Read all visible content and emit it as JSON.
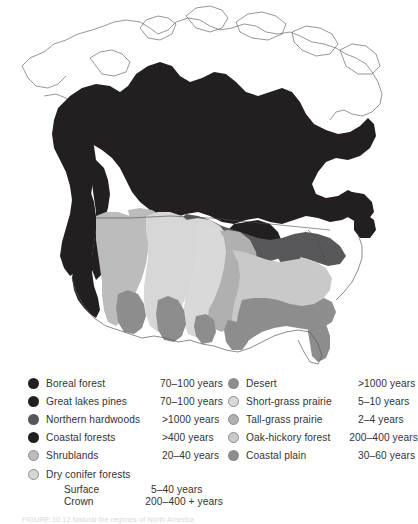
{
  "figure": {
    "title_visible": false,
    "caption": "FIGURE 10.12 Natural fire regimes of North America",
    "caption_label": "FIGURE"
  },
  "map": {
    "name": "north-america-fire-regime-map",
    "description": "Grayscale map of North America showing natural fire-return-interval vegetation zones",
    "background": "#ffffff",
    "outline_color": "#555555"
  },
  "palette": {
    "boreal_forest": "#231f20",
    "great_lakes_pines": "#231f20",
    "northern_hardwoods": "#58585b",
    "coastal_forests": "#231f20",
    "shrublands": "#bcbcbc",
    "dry_conifer_forests": "#d7d7d7",
    "desert": "#8d8d8d",
    "short_grass_prairie": "#d9d9d9",
    "tall_grass_prairie": "#b0b0b0",
    "oak_hickory_forest": "#c9c9c9",
    "coastal_plain": "#8d8d8d",
    "outline": "#555555",
    "text": "#333333"
  },
  "legend": {
    "left_column": [
      {
        "label": "Boreal forest",
        "value": "70–100 years",
        "swatch": "#231f20",
        "outlined": false
      },
      {
        "label": "Great lakes pines",
        "value": "70–100 years",
        "swatch": "#231f20",
        "outlined": false
      },
      {
        "label": "Northern hardwoods",
        "value": ">1000 years",
        "swatch": "#58585b",
        "outlined": false
      },
      {
        "label": "Coastal forests",
        "value": ">400 years",
        "swatch": "#231f20",
        "outlined": false
      },
      {
        "label": "Shrublands",
        "value": "20–40 years",
        "swatch": "#bcbcbc",
        "outlined": true
      },
      {
        "label": "Dry conifer forests",
        "value": "",
        "swatch": "#d7d7d7",
        "outlined": true
      }
    ],
    "left_sub_rows": [
      {
        "label": "Surface",
        "value": "5–40 years"
      },
      {
        "label": "Crown",
        "value": "200–400 + years"
      }
    ],
    "right_column": [
      {
        "label": "Desert",
        "value": ">1000 years",
        "swatch": "#8d8d8d",
        "outlined": false
      },
      {
        "label": "Short-grass prairie",
        "value": "5–10 years",
        "swatch": "#d9d9d9",
        "outlined": true
      },
      {
        "label": "Tall-grass prairie",
        "value": "2–4 years",
        "swatch": "#b0b0b0",
        "outlined": true
      },
      {
        "label": "Oak-hickory forest",
        "value": "200–400 years",
        "swatch": "#c9c9c9",
        "outlined": true
      },
      {
        "label": "Coastal plain",
        "value": "30–60 years",
        "swatch": "#8d8d8d",
        "outlined": false
      }
    ]
  }
}
